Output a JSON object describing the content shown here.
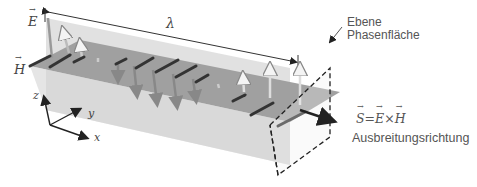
{
  "diagram": {
    "labels": {
      "E": "E",
      "H": "H",
      "lambda": "λ",
      "plane_line1": "Ebene",
      "plane_line2": "Phasenfläche",
      "poynting_S": "S",
      "poynting_eq": "=",
      "poynting_E": "E",
      "poynting_cross": "×",
      "poynting_H": "H",
      "direction": "Ausbreitungsrichtung",
      "axis_x": "x",
      "axis_y": "y",
      "axis_z": "z"
    },
    "colors": {
      "e_plane": "#d8d8d8",
      "h_plane": "#9a9a9a",
      "vector_dark": "#3a3a3a",
      "vector_light": "#e8e8e8",
      "text": "#444444"
    }
  }
}
